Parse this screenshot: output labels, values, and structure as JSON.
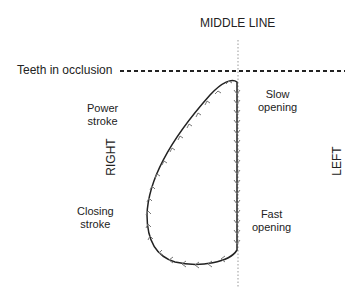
{
  "labels": {
    "middle_line": "MIDDLE LINE",
    "teeth": "Teeth in occlusion",
    "power_1": "Power",
    "power_2": "stroke",
    "slow_1": "Slow",
    "slow_2": "opening",
    "closing_1": "Closing",
    "closing_2": "stroke",
    "fast_1": "Fast",
    "fast_2": "opening",
    "right": "RIGHT",
    "left": "LEFT"
  },
  "colors": {
    "line": "#222222",
    "arrow": "#777777",
    "midline": "#999999"
  }
}
